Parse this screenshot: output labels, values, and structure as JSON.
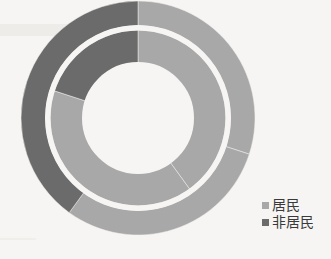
{
  "chart_data": {
    "type": "pie",
    "variant": "donut-nested",
    "title": "",
    "subtitle": "",
    "xlabel": "",
    "ylabel": "",
    "grid": false,
    "legend_position": "bottom-right",
    "categories": [
      "居民",
      "非居民"
    ],
    "colors": {
      "居民": "#a8a8a8",
      "非居民": "#6b6b6b",
      "background": "#f6f5f3",
      "separator": "#f2f1ef"
    },
    "rings": [
      {
        "name": "outer",
        "start_angle_deg": 0,
        "direction": "clockwise",
        "series": [
          {
            "name": "居民",
            "value": 60,
            "color": "#a8a8a8",
            "start_deg": 0,
            "end_deg": 216
          },
          {
            "name": "非居民",
            "value": 40,
            "color": "#6b6b6b",
            "start_deg": 216,
            "end_deg": 360
          }
        ]
      },
      {
        "name": "inner",
        "start_angle_deg": 0,
        "direction": "clockwise",
        "series": [
          {
            "name": "居民",
            "value": 80,
            "color": "#a8a8a8",
            "start_deg": 0,
            "end_deg": 288
          },
          {
            "name": "非居民",
            "value": 20,
            "color": "#6b6b6b",
            "start_deg": 288,
            "end_deg": 360
          }
        ]
      }
    ],
    "geometry": {
      "center_x": 138,
      "center_y": 118,
      "outer_ring_outer_radius": 117,
      "outer_ring_inner_radius": 92,
      "inner_ring_outer_radius": 88,
      "inner_ring_inner_radius": 55
    }
  },
  "legend": {
    "entries": [
      {
        "label": "居民",
        "color": "#a8a8a8",
        "swatch_icon": "square-swatch-icon"
      },
      {
        "label": "非居民",
        "color": "#6b6b6b",
        "swatch_icon": "square-swatch-icon"
      }
    ]
  }
}
